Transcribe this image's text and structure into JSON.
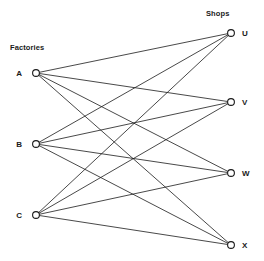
{
  "diagram": {
    "type": "bipartite-graph",
    "title": "",
    "left_group": {
      "label": "Factories",
      "label_x": 10,
      "label_y": 50,
      "nodes": [
        {
          "id": "A",
          "label": "A",
          "x": 36,
          "y": 73,
          "label_x": 22,
          "label_y": 76
        },
        {
          "id": "B",
          "label": "B",
          "x": 36,
          "y": 144,
          "label_x": 22,
          "label_y": 147
        },
        {
          "id": "C",
          "label": "C",
          "x": 36,
          "y": 215,
          "label_x": 22,
          "label_y": 218
        }
      ]
    },
    "right_group": {
      "label": "Shops",
      "label_x": 206,
      "label_y": 16,
      "nodes": [
        {
          "id": "U",
          "label": "U",
          "x": 231,
          "y": 33,
          "label_x": 242,
          "label_y": 36
        },
        {
          "id": "V",
          "label": "V",
          "x": 231,
          "y": 102,
          "label_x": 242,
          "label_y": 105
        },
        {
          "id": "W",
          "label": "W",
          "x": 231,
          "y": 173,
          "label_x": 242,
          "label_y": 176
        },
        {
          "id": "X",
          "label": "X",
          "x": 231,
          "y": 245,
          "label_x": 242,
          "label_y": 248
        }
      ]
    },
    "node_radius": 3.4,
    "edges": [
      {
        "from": "A",
        "to": "U",
        "x1": 36,
        "y1": 73,
        "x2": 231,
        "y2": 33
      },
      {
        "from": "A",
        "to": "V",
        "x1": 36,
        "y1": 73,
        "x2": 231,
        "y2": 102
      },
      {
        "from": "A",
        "to": "W",
        "x1": 36,
        "y1": 73,
        "x2": 231,
        "y2": 173
      },
      {
        "from": "A",
        "to": "X",
        "x1": 36,
        "y1": 73,
        "x2": 231,
        "y2": 245
      },
      {
        "from": "B",
        "to": "U",
        "x1": 36,
        "y1": 144,
        "x2": 231,
        "y2": 33
      },
      {
        "from": "B",
        "to": "V",
        "x1": 36,
        "y1": 144,
        "x2": 231,
        "y2": 102
      },
      {
        "from": "B",
        "to": "W",
        "x1": 36,
        "y1": 144,
        "x2": 231,
        "y2": 173
      },
      {
        "from": "B",
        "to": "X",
        "x1": 36,
        "y1": 144,
        "x2": 231,
        "y2": 245
      },
      {
        "from": "C",
        "to": "U",
        "x1": 36,
        "y1": 215,
        "x2": 231,
        "y2": 33
      },
      {
        "from": "C",
        "to": "V",
        "x1": 36,
        "y1": 215,
        "x2": 231,
        "y2": 102
      },
      {
        "from": "C",
        "to": "W",
        "x1": 36,
        "y1": 215,
        "x2": 231,
        "y2": 173
      },
      {
        "from": "C",
        "to": "X",
        "x1": 36,
        "y1": 215,
        "x2": 231,
        "y2": 245
      }
    ],
    "colors": {
      "line": "#1a1a1a",
      "node_fill": "#ffffff",
      "node_stroke": "#1a1a1a",
      "background": "#ffffff",
      "text": "#1a1a1a"
    }
  }
}
